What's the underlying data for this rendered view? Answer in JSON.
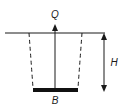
{
  "diagram": {
    "type": "foundation-footing-schematic",
    "labels": {
      "load": "Q",
      "width": "B",
      "depth": "H"
    },
    "colors": {
      "stroke": "#1a1a1a",
      "footing": "#111111",
      "background": "#ffffff"
    },
    "elements": [
      {
        "name": "ground-surface-line",
        "kind": "solid line"
      },
      {
        "name": "load-arrow",
        "kind": "upward arrow",
        "label": "Q"
      },
      {
        "name": "excavation-boundary-left",
        "kind": "dashed curve"
      },
      {
        "name": "excavation-boundary-right",
        "kind": "dashed curve"
      },
      {
        "name": "footing-plate",
        "kind": "filled bar",
        "label": "B"
      },
      {
        "name": "depth-dimension-arrow",
        "kind": "double-headed arrow",
        "label": "H"
      }
    ]
  }
}
